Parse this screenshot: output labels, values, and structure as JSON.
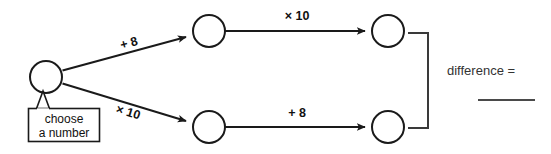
{
  "diagram": {
    "type": "number-machine-flow",
    "background_color": "#ffffff",
    "stroke_color": "#1a1a1a",
    "nodes": [
      {
        "id": "start",
        "name": "start-node",
        "cx": 46,
        "cy": 77,
        "r": 16,
        "value": ""
      },
      {
        "id": "top-middle",
        "name": "top-middle-node",
        "cx": 209,
        "cy": 31,
        "r": 16,
        "value": ""
      },
      {
        "id": "top-right",
        "name": "top-right-node",
        "cx": 388,
        "cy": 31,
        "r": 16,
        "value": ""
      },
      {
        "id": "bottom-middle",
        "name": "bottom-middle-node",
        "cx": 209,
        "cy": 127,
        "r": 16,
        "value": ""
      },
      {
        "id": "bottom-right",
        "name": "bottom-right-node",
        "cx": 388,
        "cy": 127,
        "r": 16,
        "value": ""
      }
    ],
    "edges": [
      {
        "id": "start-to-top",
        "label": "+ 8",
        "from": "start",
        "to": "top-middle",
        "orientation": "diagonal-up"
      },
      {
        "id": "start-to-bottom",
        "label": "× 10",
        "from": "start",
        "to": "bottom-middle",
        "orientation": "diagonal-down"
      },
      {
        "id": "top-middle-to-right",
        "label": "× 10",
        "from": "top-middle",
        "to": "top-right",
        "orientation": "horizontal"
      },
      {
        "id": "bottom-middle-to-right",
        "label": "+ 8",
        "from": "bottom-middle",
        "to": "bottom-right",
        "orientation": "horizontal"
      }
    ],
    "callout": {
      "line1": "choose",
      "line2": "a number",
      "attached_to": "start"
    },
    "result": {
      "label": "difference =",
      "answer_value": "",
      "has_blank_answer_line": true
    }
  }
}
